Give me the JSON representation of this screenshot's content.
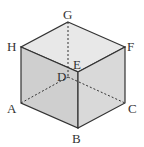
{
  "diagram": {
    "type": "cube-perspective",
    "vertices": {
      "G": {
        "label": "G",
        "x": 68,
        "y": 22
      },
      "H": {
        "label": "H",
        "x": 21,
        "y": 47
      },
      "F": {
        "label": "F",
        "x": 125,
        "y": 47
      },
      "E": {
        "label": "E",
        "x": 78,
        "y": 72
      },
      "A": {
        "label": "A",
        "x": 21,
        "y": 103
      },
      "B": {
        "label": "B",
        "x": 78,
        "y": 128
      },
      "C": {
        "label": "C",
        "x": 125,
        "y": 103
      },
      "D": {
        "label": "D",
        "x": 68,
        "y": 77
      }
    },
    "hidden_edges": [
      "GD",
      "AD",
      "DC"
    ],
    "colors": {
      "top_face": "#e8e8e8",
      "left_face": "#cfcfcf",
      "right_face": "#d9d9d9",
      "edge": "#333333"
    }
  }
}
